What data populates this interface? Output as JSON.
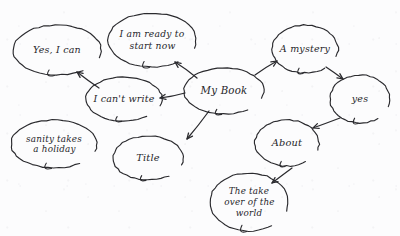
{
  "diagram": {
    "style": "hand-drawn",
    "ink_color": "#2a2a2e",
    "paper_color": "#fcfcfd",
    "nodes": [
      {
        "id": "yes-i-can",
        "label": "Yes, I can",
        "lines": [
          "Yes, I can"
        ],
        "cx": 57,
        "cy": 50,
        "rx": 44,
        "ry": 25,
        "font_size": 9.5
      },
      {
        "id": "i-am-ready",
        "label": "I am ready to start now",
        "lines": [
          "I am ready to",
          "start now"
        ],
        "cx": 152,
        "cy": 40,
        "rx": 44,
        "ry": 27,
        "font_size": 9.2
      },
      {
        "id": "my-book",
        "label": "My Book",
        "lines": [
          "My Book"
        ],
        "cx": 224,
        "cy": 91,
        "rx": 40,
        "ry": 23,
        "font_size": 10.2
      },
      {
        "id": "a-mystery",
        "label": "A mystery",
        "lines": [
          "A mystery"
        ],
        "cx": 305,
        "cy": 49,
        "rx": 33,
        "ry": 24,
        "font_size": 9.5
      },
      {
        "id": "yes",
        "label": "yes",
        "lines": [
          "yes"
        ],
        "cx": 360,
        "cy": 99,
        "rx": 30,
        "ry": 24,
        "font_size": 9.5
      },
      {
        "id": "i-cant-write",
        "label": "I can't write",
        "lines": [
          "I can't write"
        ],
        "cx": 124,
        "cy": 99,
        "rx": 38,
        "ry": 22,
        "font_size": 9.5
      },
      {
        "id": "sanity-takes-a-holiday",
        "label": "sanity takes a holiday",
        "lines": [
          "sanity takes",
          "a holiday"
        ],
        "cx": 54,
        "cy": 144,
        "rx": 43,
        "ry": 24,
        "font_size": 8.8
      },
      {
        "id": "title",
        "label": "Title",
        "lines": [
          "Title"
        ],
        "cx": 148,
        "cy": 158,
        "rx": 35,
        "ry": 22,
        "font_size": 9.8
      },
      {
        "id": "about",
        "label": "About",
        "lines": [
          "About"
        ],
        "cx": 287,
        "cy": 143,
        "rx": 32,
        "ry": 23,
        "font_size": 9.8
      },
      {
        "id": "take-over-world",
        "label": "The take over of the world",
        "lines": [
          "The take",
          "over of the",
          "world"
        ],
        "cx": 249,
        "cy": 202,
        "rx": 39,
        "ry": 29,
        "font_size": 8.8
      }
    ],
    "edges": [
      {
        "id": "my-book-to-i-am-ready",
        "from": "my-book",
        "to": "i-am-ready",
        "x1": 197,
        "y1": 78,
        "x2": 175,
        "y2": 62
      },
      {
        "id": "my-book-to-i-cant-write",
        "from": "my-book",
        "to": "i-cant-write",
        "x1": 185,
        "y1": 93,
        "x2": 160,
        "y2": 98
      },
      {
        "id": "my-book-to-a-mystery",
        "from": "my-book",
        "to": "a-mystery",
        "x1": 255,
        "y1": 75,
        "x2": 277,
        "y2": 61
      },
      {
        "id": "my-book-to-title",
        "from": "my-book",
        "to": "title",
        "x1": 209,
        "y1": 111,
        "x2": 187,
        "y2": 139
      },
      {
        "id": "i-cant-write-to-yes-i-can",
        "from": "i-cant-write",
        "to": "yes-i-can",
        "x1": 99,
        "y1": 88,
        "x2": 77,
        "y2": 72
      },
      {
        "id": "a-mystery-to-yes",
        "from": "a-mystery",
        "to": "yes",
        "x1": 326,
        "y1": 67,
        "x2": 343,
        "y2": 79
      },
      {
        "id": "yes-to-about",
        "from": "yes",
        "to": "about",
        "x1": 340,
        "y1": 118,
        "x2": 313,
        "y2": 128
      },
      {
        "id": "about-to-take-over-world",
        "from": "about",
        "to": "take-over-world",
        "x1": 292,
        "y1": 168,
        "x2": 272,
        "y2": 183
      }
    ]
  }
}
